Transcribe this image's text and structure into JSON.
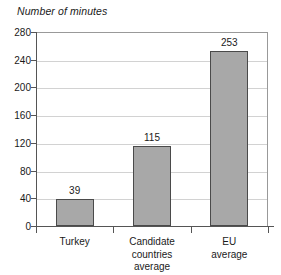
{
  "chart_data": {
    "type": "bar",
    "title": "Number of minutes",
    "xlabel": "",
    "ylabel": "Number of minutes",
    "categories": [
      "Turkey",
      "Candidate\ncountries\naverage",
      "EU average"
    ],
    "values": [
      39,
      115,
      253
    ],
    "value_labels": [
      "39",
      "115",
      "253"
    ],
    "ylim": [
      0,
      280
    ],
    "yticks": [
      0,
      40,
      80,
      120,
      160,
      200,
      240,
      280
    ],
    "ytick_labels": [
      "0",
      "40",
      "80",
      "120",
      "160",
      "200",
      "240",
      "280"
    ],
    "grid": "horizontal",
    "legend": "none",
    "bar_color": "#a8a8a8",
    "bar_border_color": "#4a4a4a",
    "gridline_color": "#d2d2d2",
    "axis_color": "#555555",
    "background": "#ffffff"
  }
}
